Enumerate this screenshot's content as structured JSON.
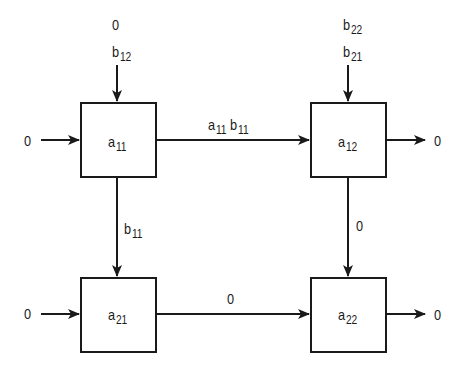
{
  "diagram": {
    "type": "systolic-array",
    "cells": [
      {
        "id": "a11",
        "base": "a",
        "sub": "11"
      },
      {
        "id": "a12",
        "base": "a",
        "sub": "12"
      },
      {
        "id": "a21",
        "base": "a",
        "sub": "21"
      },
      {
        "id": "a22",
        "base": "a",
        "sub": "22"
      }
    ],
    "inputs": {
      "a11_top_first": {
        "text": "0"
      },
      "a11_top_second": {
        "base": "b",
        "sub": "12"
      },
      "a12_top_first": {
        "base": "b",
        "sub": "22"
      },
      "a12_top_second": {
        "base": "b",
        "sub": "21"
      },
      "a11_left": {
        "text": "0"
      },
      "a21_left": {
        "text": "0"
      }
    },
    "edges": {
      "a11_to_a12": {
        "base1": "a",
        "sub1": "11",
        "base2": "b",
        "sub2": "11"
      },
      "a11_to_a21": {
        "base": "b",
        "sub": "11"
      },
      "a12_to_a22": {
        "text": "0"
      },
      "a21_to_a22": {
        "text": "0"
      }
    },
    "outputs": {
      "a12_right": {
        "text": "0"
      },
      "a22_right": {
        "text": "0"
      }
    }
  }
}
